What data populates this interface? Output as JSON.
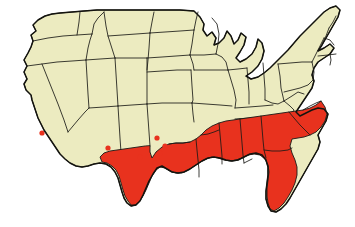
{
  "figure": {
    "kind": "choropleth-range-map",
    "region": "United States (contiguous 48 states)",
    "title": "",
    "caption": "",
    "background_color": "#ffffff"
  },
  "colors": {
    "shaded": "#e8321e",
    "unshaded": "#ecebc0",
    "outline": "#1a1a16",
    "coast_outline": "#14140f",
    "background": "#ffffff",
    "dot": "#e8321e"
  },
  "legend": {
    "visible": false,
    "entries": [
      {
        "label": "Range / present",
        "color": "#e8321e"
      },
      {
        "label": "Absent",
        "color": "#ecebc0"
      },
      {
        "label": "Isolated occurrence",
        "color": "#e8321e"
      }
    ]
  },
  "chart_data": {
    "type": "map",
    "title": "",
    "xlabel": "",
    "ylabel": "",
    "projection": "simplified-albers",
    "value_scheme": "binary",
    "shaded_states": [
      "Texas",
      "Louisiana",
      "Mississippi",
      "Alabama",
      "Georgia",
      "Florida",
      "South Carolina",
      "North Carolina (southern/coastal)",
      "Arkansas (southern)"
    ],
    "partially_shaded_states": [
      "Arkansas",
      "North Carolina",
      "Oklahoma (southeastern edge)",
      "California (extreme south)"
    ],
    "unshaded_states": [
      "Washington",
      "Oregon",
      "California",
      "Idaho",
      "Nevada",
      "Montana",
      "Wyoming",
      "Utah",
      "Arizona",
      "Colorado",
      "New Mexico",
      "North Dakota",
      "South Dakota",
      "Nebraska",
      "Kansas",
      "Oklahoma",
      "Minnesota",
      "Iowa",
      "Missouri",
      "Wisconsin",
      "Illinois",
      "Michigan",
      "Indiana",
      "Ohio",
      "Kentucky",
      "Tennessee",
      "West Virginia",
      "Virginia",
      "Maryland",
      "Delaware",
      "Pennsylvania",
      "New Jersey",
      "New York",
      "Connecticut",
      "Rhode Island",
      "Massachusetts",
      "Vermont",
      "New Hampshire",
      "Maine"
    ],
    "isolated_occurrence_points": [
      {
        "id": "pt-1",
        "x": 42,
        "y": 133,
        "approx_location": "extreme southern California"
      },
      {
        "id": "pt-2",
        "x": 108,
        "y": 148,
        "approx_location": "southwestern New Mexico"
      },
      {
        "id": "pt-3",
        "x": 140,
        "y": 157,
        "approx_location": "far west Texas"
      },
      {
        "id": "pt-4",
        "x": 155,
        "y": 163,
        "approx_location": "west Texas"
      },
      {
        "id": "pt-5",
        "x": 157,
        "y": 138,
        "approx_location": "Texas panhandle region"
      },
      {
        "id": "pt-6",
        "x": 160,
        "y": 153,
        "approx_location": "west-central Texas"
      },
      {
        "id": "pt-7",
        "x": 165,
        "y": 146,
        "approx_location": "northwest Texas"
      }
    ]
  }
}
